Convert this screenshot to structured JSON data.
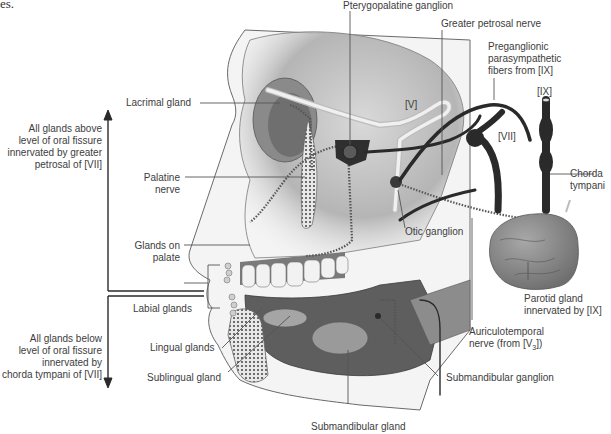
{
  "caption_fragment": "es.",
  "diagram": {
    "brackets": {
      "upper": {
        "lines": [
          "All glands above",
          "level of oral fissure",
          "innervated by greater",
          "petrosal of [VII]"
        ]
      },
      "lower": {
        "lines": [
          "All glands below",
          "level of oral fissure",
          "innervated by",
          "chorda tympani of [VII]"
        ]
      }
    },
    "labels": {
      "lacrimal_gland": "Lacrimal gland",
      "palatine_nerve": [
        "Palatine",
        "nerve"
      ],
      "glands_on_palate": [
        "Glands on",
        "palate"
      ],
      "labial_glands": "Labial glands",
      "lingual_glands": "Lingual glands",
      "sublingual_gland": "Sublingual gland",
      "submandibular_gland": "Submandibular gland",
      "submandibular_ganglion": "Submandibular ganglion",
      "pterygopalatine_ganglion": "Pterygopalatine ganglion",
      "greater_petrosal_nerve": "Greater petrosal nerve",
      "preganglionic": [
        "Preganglionic",
        "parasympathetic",
        "fibers from [IX]"
      ],
      "cn_ix": "[IX]",
      "cn_v": "[V]",
      "cn_vii": "[VII]",
      "chorda_tympani": [
        "Chorda",
        "tympani"
      ],
      "otic_ganglion": "Otic ganglion",
      "parotid_gland": [
        "Parotid gland",
        "innervated by [IX]"
      ],
      "auriculotemporal": [
        "Auriculotemporal",
        "nerve (from [V",
        "3",
        "])"
      ]
    },
    "colors": {
      "background": "#ffffff",
      "text": "#3d3d3d",
      "leader_line": "#555555",
      "skin_outline": "#6a6a6a",
      "bone_shade": "#b8b8b8",
      "nerve_dark": "#2a2a2a",
      "gland_gray": "#8e8e8e"
    }
  }
}
